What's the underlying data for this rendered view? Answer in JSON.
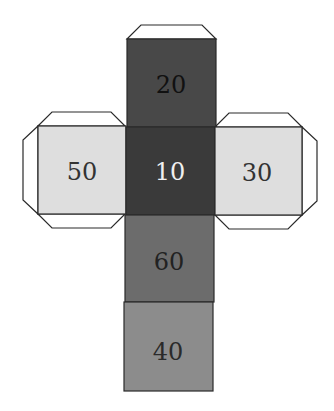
{
  "diagram": {
    "type": "cube-net",
    "faces": [
      {
        "id": "top",
        "label": "20",
        "fill": "#484848",
        "text_color": "#111111"
      },
      {
        "id": "left",
        "label": "50",
        "fill": "#dedede",
        "text_color": "#333333"
      },
      {
        "id": "center",
        "label": "10",
        "fill": "#3a3a3a",
        "text_color": "#f0f0f0"
      },
      {
        "id": "right",
        "label": "30",
        "fill": "#dedede",
        "text_color": "#333333"
      },
      {
        "id": "lower",
        "label": "60",
        "fill": "#6c6c6c",
        "text_color": "#222222"
      },
      {
        "id": "bottom",
        "label": "40",
        "fill": "#8c8c8c",
        "text_color": "#2a2a2a"
      }
    ],
    "tab_fill": "#ffffff",
    "stroke": "#2a2a2a"
  }
}
